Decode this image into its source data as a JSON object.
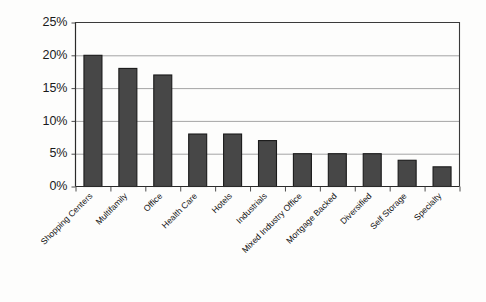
{
  "chart_data": {
    "type": "bar",
    "title": "",
    "xlabel": "",
    "ylabel": "",
    "categories": [
      "Shopping Centers",
      "Multifamily",
      "Office",
      "Health Care",
      "Hotels",
      "Industrials",
      "Mixed Industry Office",
      "Mortgage Backed",
      "Diversified",
      "Self Storage",
      "Specialty"
    ],
    "values": [
      20,
      18,
      17,
      8,
      8,
      7,
      5,
      5,
      5,
      4,
      3
    ],
    "value_unit": "%",
    "ylim": [
      0,
      25
    ],
    "ytick_values": [
      0,
      5,
      10,
      15,
      20,
      25
    ],
    "ytick_labels": [
      "0%",
      "5%",
      "10%",
      "15%",
      "20%",
      "25%"
    ],
    "grid": true,
    "grid_axis": "y",
    "legend": false,
    "legend_position": "none",
    "xtick_label_rotation": -45,
    "bar_color": "#474747",
    "bar_edge_color": "#1a1a1a",
    "gridline_color": "#9a9a9a",
    "axis_color": "#2a2a2a",
    "background_color": "#fdfdfc"
  }
}
